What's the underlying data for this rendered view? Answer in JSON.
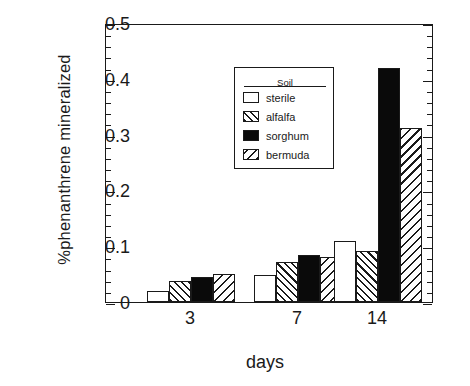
{
  "chart_data": {
    "type": "bar",
    "title": "",
    "xlabel": "days",
    "ylabel": "%phenanthrene  mineralized",
    "categories": [
      "3",
      "7",
      "14"
    ],
    "ylim": [
      0,
      0.5
    ],
    "ytick_labels": [
      "0",
      "0.1",
      "0.2",
      "0.3",
      "0.4",
      "0.5"
    ],
    "ytick_values": [
      0,
      0.1,
      0.2,
      0.3,
      0.4,
      0.5
    ],
    "yminor_interval": 0.02,
    "grid": false,
    "legend_title": "Soil",
    "legend_position": "upper-left-inside",
    "series": [
      {
        "name": "sterile",
        "fill": "white",
        "values": [
          0.02,
          0.048,
          0.11
        ]
      },
      {
        "name": "alfalfa",
        "fill": "hatch-up",
        "values": [
          0.038,
          0.072,
          0.092
        ]
      },
      {
        "name": "sorghum",
        "fill": "solid-black",
        "values": [
          0.045,
          0.085,
          0.42
        ]
      },
      {
        "name": "bermuda",
        "fill": "hatch-down",
        "values": [
          0.05,
          0.08,
          0.312
        ]
      }
    ]
  },
  "colors": {
    "ink": "#1a1a1a",
    "background": "#ffffff",
    "solid_fill": "#0a0a0a"
  }
}
